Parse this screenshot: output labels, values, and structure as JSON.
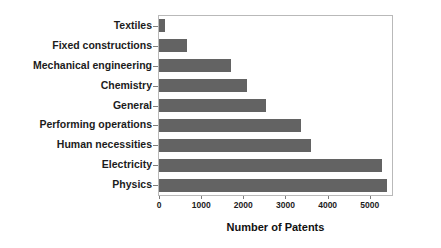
{
  "chart_data": {
    "type": "bar",
    "orientation": "horizontal",
    "title": "",
    "xlabel": "Number of Patents",
    "ylabel": "",
    "categories": [
      "Textiles",
      "Fixed constructions",
      "Mechanical engineering",
      "Chemistry",
      "General",
      "Performing operations",
      "Human necessities",
      "Electricity",
      "Physics"
    ],
    "values": [
      140,
      660,
      1700,
      2080,
      2540,
      3360,
      3600,
      5280,
      5400
    ],
    "xlim": [
      0,
      5550
    ],
    "xticks": [
      0,
      1000,
      2000,
      3000,
      4000,
      5000
    ],
    "xtick_labels": [
      "0",
      "1000",
      "2000",
      "3000",
      "4000",
      "5000"
    ],
    "grid": false,
    "legend": null,
    "bar_color": "#636363",
    "frame_color": "#b9b9b9",
    "background": "#ffffff"
  }
}
